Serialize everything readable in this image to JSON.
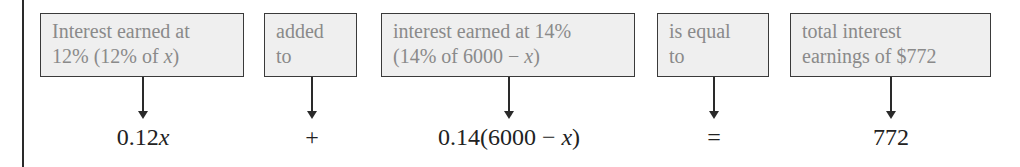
{
  "diagram": {
    "type": "verbal-to-equation translation",
    "boxes": [
      {
        "line1": "Interest earned at",
        "line2_pre": "12% (12% of ",
        "line2_var": "x",
        "line2_post": ")"
      },
      {
        "line1": "added",
        "line2": "to"
      },
      {
        "line1": "interest earned at 14%",
        "line2_pre": "(14% of 6000  −  ",
        "line2_var": "x",
        "line2_post": ")"
      },
      {
        "line1": "is equal",
        "line2": "to"
      },
      {
        "line1": "total interest",
        "line2": "earnings of $772"
      }
    ],
    "expressions": [
      {
        "pre": "0.12",
        "var": "x",
        "post": ""
      },
      {
        "pre": "+",
        "var": "",
        "post": ""
      },
      {
        "pre": "0.14(6000  −  ",
        "var": "x",
        "post": ")"
      },
      {
        "pre": "=",
        "var": "",
        "post": ""
      },
      {
        "pre": "772",
        "var": "",
        "post": ""
      }
    ],
    "colors": {
      "box_fill": "#efefef",
      "box_border": "#3a3a3a",
      "box_text": "#8a8a8a",
      "expr_text": "#222222"
    }
  }
}
